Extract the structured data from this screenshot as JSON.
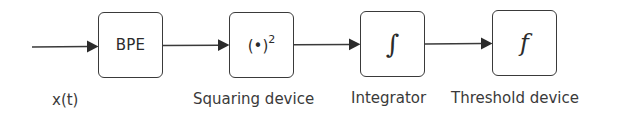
{
  "diagram": {
    "type": "block-diagram",
    "title": "",
    "input": {
      "label": "x(t)"
    },
    "blocks": [
      {
        "id": "bpe",
        "symbol": "BPE",
        "label": ""
      },
      {
        "id": "squaring",
        "symbol": "(•)",
        "symbol_sup": "2",
        "label": "Squaring device"
      },
      {
        "id": "integrator",
        "symbol": "∫",
        "label": "Integrator"
      },
      {
        "id": "threshold",
        "symbol": "f",
        "label": "Threshold device"
      }
    ],
    "connections": [
      {
        "from": "x(t)",
        "to": "bpe"
      },
      {
        "from": "bpe",
        "to": "squaring"
      },
      {
        "from": "squaring",
        "to": "integrator"
      },
      {
        "from": "integrator",
        "to": "threshold"
      }
    ],
    "colors": {
      "stroke": "#3a3a3a",
      "text": "#2b2b2b",
      "background": "#ffffff"
    }
  }
}
